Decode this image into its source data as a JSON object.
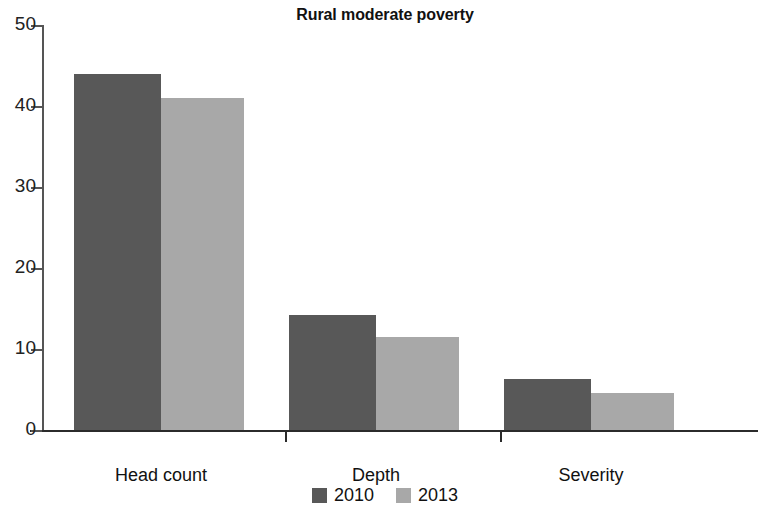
{
  "chart_data": {
    "type": "bar",
    "title": "Rural moderate poverty",
    "xlabel": "",
    "ylabel": "",
    "categories": [
      "Head count",
      "Depth",
      "Severity"
    ],
    "series": [
      {
        "name": "2010",
        "color": "#585858",
        "values": [
          44,
          14.2,
          6.3
        ]
      },
      {
        "name": "2013",
        "color": "#a8a8a8",
        "values": [
          41,
          11.5,
          4.6
        ]
      }
    ],
    "ylim": [
      0,
      50
    ],
    "yticks": [
      0,
      10,
      20,
      30,
      40,
      50
    ],
    "ytick_labels": [
      "0",
      "10",
      "20",
      "30",
      "40",
      "50"
    ],
    "grid": false,
    "legend_position": "bottom"
  },
  "legend": {
    "items": [
      {
        "label": "2010",
        "color": "#585858"
      },
      {
        "label": "2013",
        "color": "#a8a8a8"
      }
    ]
  },
  "axis": {
    "y_tick_labels": [
      "50",
      "40",
      "30",
      "20",
      "10",
      "0"
    ]
  }
}
